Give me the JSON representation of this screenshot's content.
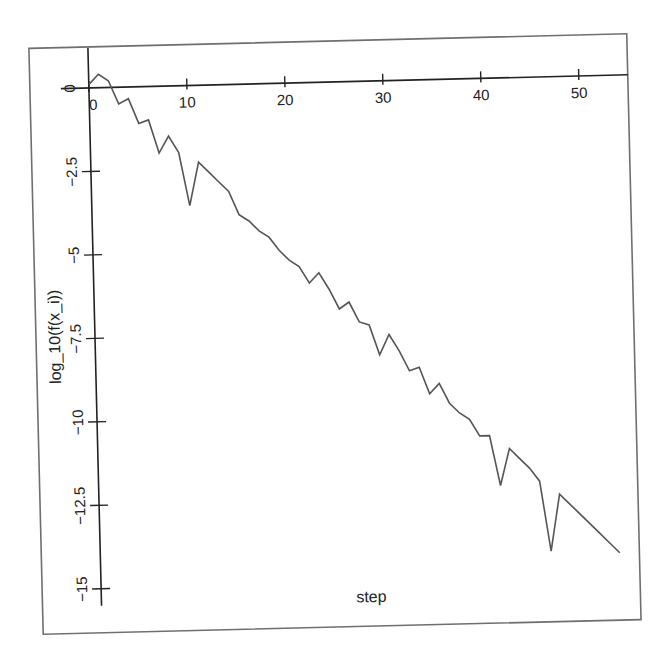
{
  "chart_data": {
    "type": "line",
    "title": "",
    "xlabel": "step",
    "ylabel": "log_10(f(x_i))",
    "xlim": [
      -2.5,
      54.5
    ],
    "ylim": [
      -15.5,
      1.2
    ],
    "grid": false,
    "legend": null,
    "x_ticks": [
      0,
      10,
      20,
      30,
      40,
      50
    ],
    "x_tick_labels": [
      "0",
      "10",
      "20",
      "30",
      "40",
      "50"
    ],
    "y_ticks": [
      0,
      -2.5,
      -5,
      -7.5,
      -10,
      -12.5,
      -15
    ],
    "y_tick_labels": [
      "0",
      "-2.5",
      "-5",
      "-7.5",
      "-10",
      "-12.5",
      "-15"
    ],
    "series": [
      {
        "name": "log_10(f(x_i))",
        "x": [
          0,
          1,
          2,
          3,
          4,
          5,
          6,
          7,
          8,
          9,
          10,
          11,
          12,
          13,
          14,
          15,
          16,
          17,
          18,
          19,
          20,
          21,
          22,
          23,
          24,
          25,
          26,
          27,
          28,
          29,
          30,
          31,
          32,
          33,
          34,
          35,
          36,
          37,
          38,
          39,
          40,
          41,
          42,
          43,
          44,
          45,
          46,
          47,
          48,
          49,
          50,
          51,
          52,
          53
        ],
        "values": [
          0.1,
          0.4,
          0.2,
          -0.5,
          -0.35,
          -1.1,
          -1.0,
          -2.0,
          -1.5,
          -2.0,
          -3.6,
          -2.3,
          -2.6,
          -2.9,
          -3.2,
          -3.9,
          -4.1,
          -4.4,
          -4.6,
          -5.0,
          -5.3,
          -5.5,
          -6.0,
          -5.7,
          -6.2,
          -6.8,
          -6.6,
          -7.2,
          -7.3,
          -8.2,
          -7.6,
          -8.1,
          -8.7,
          -8.6,
          -9.4,
          -9.1,
          -9.7,
          -10.0,
          -10.2,
          -10.7,
          -10.7,
          -12.2,
          -11.1,
          -11.4,
          -11.7,
          -12.1,
          -14.2,
          -12.5,
          -12.8,
          -13.1,
          -13.4,
          -13.7,
          -14.0,
          -14.3
        ]
      }
    ]
  },
  "labels": {
    "xlabel": "step",
    "ylabel": "log_10(f(x_i))"
  },
  "colors": {
    "line": "#555555",
    "axis": "#222222",
    "frame": "#6f6f6f"
  }
}
